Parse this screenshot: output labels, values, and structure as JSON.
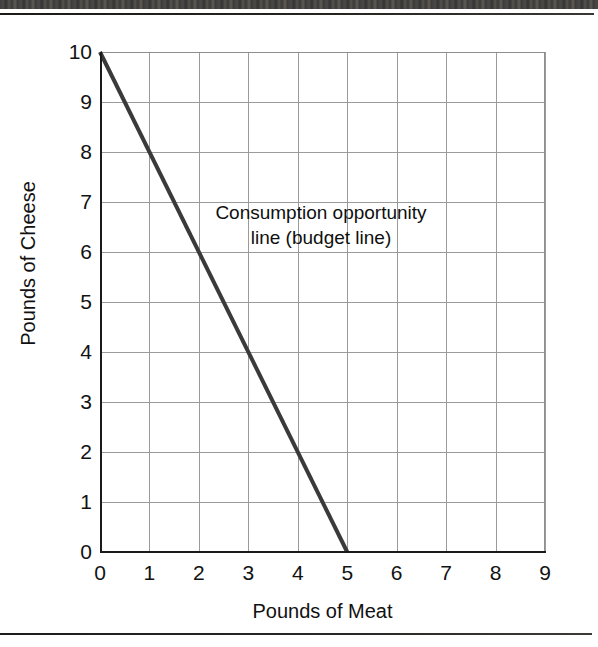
{
  "figure": {
    "background_color": "#ffffff",
    "line_color": "#3a3a3a",
    "grid_color": "#9b9b9b",
    "axis_color": "#1a1a1a",
    "annotation_line_1": "Consumption opportunity",
    "annotation_line_2": "line (budget line)"
  },
  "chart_data": {
    "type": "line",
    "title": "",
    "subtitle": "",
    "xlabel": "Pounds of Meat",
    "ylabel": "Pounds of Cheese",
    "xlim": [
      0,
      9
    ],
    "ylim": [
      0,
      10
    ],
    "xticks": [
      0,
      1,
      2,
      3,
      4,
      5,
      6,
      7,
      8,
      9
    ],
    "yticks": [
      0,
      1,
      2,
      3,
      4,
      5,
      6,
      7,
      8,
      9,
      10
    ],
    "xtick_labels": [
      "0",
      "1",
      "2",
      "3",
      "4",
      "5",
      "6",
      "7",
      "8",
      "9"
    ],
    "ytick_labels": [
      "0",
      "1",
      "2",
      "3",
      "4",
      "5",
      "6",
      "7",
      "8",
      "9",
      "10"
    ],
    "grid": true,
    "legend": false,
    "legend_position": "none",
    "annotations": [
      {
        "text": "Consumption opportunity\nline (budget line)",
        "x": 3.6,
        "y": 6.7,
        "align": "center"
      }
    ],
    "series": [
      {
        "name": "Consumption opportunity line (budget line)",
        "type": "line",
        "color": "#3a3a3a",
        "linewidth": 4,
        "x": [
          0,
          5
        ],
        "y": [
          10,
          0
        ],
        "slope": -2,
        "intercept": 10,
        "points": [
          {
            "x": 0,
            "y": 10
          },
          {
            "x": 1,
            "y": 8
          },
          {
            "x": 2,
            "y": 6
          },
          {
            "x": 3,
            "y": 4
          },
          {
            "x": 4,
            "y": 2
          },
          {
            "x": 5,
            "y": 0
          }
        ]
      }
    ]
  }
}
